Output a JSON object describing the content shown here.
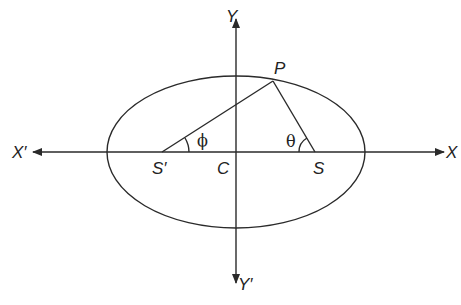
{
  "diagram": {
    "axes": {
      "x_positive": "X",
      "x_negative": "X′",
      "y_positive": "Y",
      "y_negative": "Y′"
    },
    "points": {
      "center": "C",
      "focus_right": "S",
      "focus_left": "S′",
      "point_on_ellipse": "P"
    },
    "angles": {
      "at_focus_left": "ϕ",
      "at_focus_right": "θ"
    },
    "colors": {
      "stroke": "#2a2a2a",
      "background": "#ffffff"
    }
  }
}
